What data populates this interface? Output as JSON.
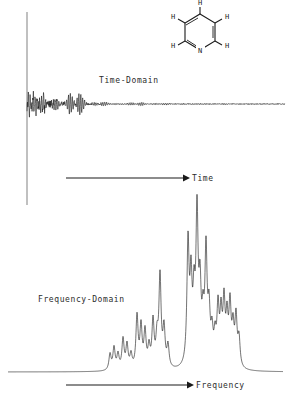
{
  "figure": {
    "ink_color": "#1a1a1a",
    "background_color": "#ffffff"
  },
  "labels": {
    "time_domain": "Time-Domain",
    "frequency_domain": "Frequency-Domain",
    "time_axis": "Time",
    "frequency_axis": "Frequency"
  },
  "molecule": {
    "name": "pyridine-structure",
    "ring_atoms": [
      "C",
      "C",
      "C",
      "C",
      "C",
      "N"
    ],
    "heteroatom_label": "N",
    "hydrogen_label": "H",
    "hydrogen_count": 5,
    "hydrogen_positions": [
      "top",
      "upper-left",
      "upper-right",
      "lower-left",
      "lower-right"
    ]
  },
  "chart_data": [
    {
      "type": "line",
      "name": "time-domain-fid",
      "title": "Time-Domain",
      "xlabel": "Time",
      "ylabel": "",
      "grid": false,
      "legend": "none",
      "baseline_y": 104,
      "xlim": [
        0,
        289
      ],
      "ylim": [
        -95,
        95
      ],
      "description": "Free induction decay: large oscillating envelope decaying to baseline noise",
      "envelope": {
        "decay_constant": 0.055,
        "beat_frequencies": [
          0.62,
          1.17,
          1.85,
          2.43
        ],
        "carrier_frequency": 3.3,
        "initial_amplitude": 78
      },
      "x": [
        27,
        30,
        33,
        36,
        39,
        42,
        45,
        48,
        51,
        54,
        57,
        60,
        63,
        66,
        69,
        72,
        78,
        84,
        90,
        96,
        102,
        110,
        120,
        130,
        140,
        150,
        165,
        180,
        200,
        220,
        240,
        260,
        285
      ],
      "envelope_amplitude": [
        78,
        66,
        70,
        58,
        62,
        48,
        52,
        40,
        44,
        33,
        36,
        26,
        29,
        20,
        23,
        16,
        22,
        13,
        16,
        9,
        12,
        7,
        9,
        5,
        6,
        4,
        5,
        3,
        2,
        2,
        1,
        1,
        0
      ]
    },
    {
      "type": "line",
      "name": "frequency-domain-spectrum",
      "title": "Frequency-Domain",
      "xlabel": "Frequency",
      "ylabel": "",
      "grid": false,
      "legend": "none",
      "baseline_y": 372,
      "xlim": [
        0,
        289
      ],
      "ylim": [
        0,
        150
      ],
      "description": "Proton NMR spectrum of pyridine: three multiplet groups of sharp lines",
      "peaks": [
        {
          "x": 110,
          "height": 16,
          "width": 1.3
        },
        {
          "x": 114,
          "height": 22,
          "width": 1.3
        },
        {
          "x": 118,
          "height": 15,
          "width": 1.3
        },
        {
          "x": 123,
          "height": 30,
          "width": 1.3
        },
        {
          "x": 127,
          "height": 24,
          "width": 1.3
        },
        {
          "x": 131,
          "height": 14,
          "width": 1.3
        },
        {
          "x": 137,
          "height": 52,
          "width": 1.3
        },
        {
          "x": 141,
          "height": 41,
          "width": 1.3
        },
        {
          "x": 145,
          "height": 36,
          "width": 1.3
        },
        {
          "x": 149,
          "height": 20,
          "width": 1.3
        },
        {
          "x": 153,
          "height": 46,
          "width": 1.3
        },
        {
          "x": 157,
          "height": 28,
          "width": 1.3
        },
        {
          "x": 160,
          "height": 90,
          "width": 1.3
        },
        {
          "x": 164,
          "height": 38,
          "width": 1.3
        },
        {
          "x": 168,
          "height": 22,
          "width": 1.3
        },
        {
          "x": 188,
          "height": 120,
          "width": 1.3
        },
        {
          "x": 191,
          "height": 78,
          "width": 1.3
        },
        {
          "x": 194,
          "height": 60,
          "width": 1.3
        },
        {
          "x": 197,
          "height": 145,
          "width": 1.3
        },
        {
          "x": 200,
          "height": 70,
          "width": 1.3
        },
        {
          "x": 203,
          "height": 40,
          "width": 1.3
        },
        {
          "x": 206,
          "height": 110,
          "width": 1.3
        },
        {
          "x": 209,
          "height": 50,
          "width": 1.3
        },
        {
          "x": 212,
          "height": 30,
          "width": 1.3
        },
        {
          "x": 215,
          "height": 26,
          "width": 1.3
        },
        {
          "x": 218,
          "height": 55,
          "width": 1.3
        },
        {
          "x": 221,
          "height": 48,
          "width": 1.3
        },
        {
          "x": 224,
          "height": 60,
          "width": 1.3
        },
        {
          "x": 227,
          "height": 44,
          "width": 1.3
        },
        {
          "x": 230,
          "height": 58,
          "width": 1.3
        },
        {
          "x": 233,
          "height": 36,
          "width": 1.3
        },
        {
          "x": 236,
          "height": 48,
          "width": 1.3
        },
        {
          "x": 239,
          "height": 28,
          "width": 1.3
        }
      ]
    }
  ],
  "axes": {
    "time_arrow": {
      "x1": 66,
      "x2": 186,
      "y": 178
    },
    "frequency_arrow": {
      "x1": 66,
      "x2": 190,
      "y": 385
    },
    "vertical_marker": {
      "x": 27,
      "y1": 12,
      "y2": 205
    }
  }
}
